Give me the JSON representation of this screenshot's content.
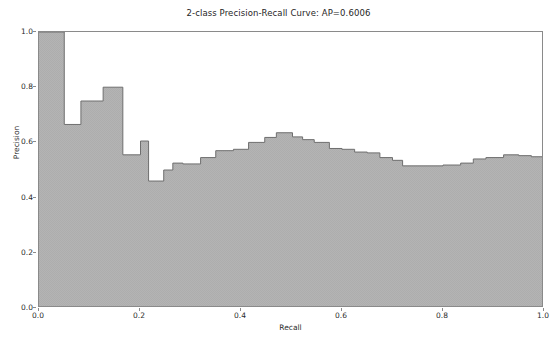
{
  "chart_data": {
    "type": "area",
    "title": "2-class Precision-Recall Curve: AP=0.6006",
    "xlabel": "Recall",
    "ylabel": "Precision",
    "xlim": [
      0.0,
      1.0
    ],
    "ylim": [
      0.0,
      1.0
    ],
    "grid": false,
    "legend": null,
    "step_mode": "post",
    "fill": true,
    "fill_color": "#adadad",
    "line_color": "#6e6e6e",
    "average_precision": 0.6006,
    "xticks": [
      0.0,
      0.2,
      0.4,
      0.6,
      0.8,
      1.0
    ],
    "xtick_labels": [
      "0.0",
      "0.2",
      "0.4",
      "0.6",
      "0.8",
      "1.0"
    ],
    "yticks": [
      0.0,
      0.2,
      0.4,
      0.6,
      0.8,
      1.0
    ],
    "ytick_labels": [
      "0.0",
      "0.2",
      "0.4",
      "0.6",
      "0.8",
      "1.0"
    ],
    "x": [
      0.0,
      0.05,
      0.083,
      0.127,
      0.166,
      0.201,
      0.217,
      0.247,
      0.265,
      0.285,
      0.32,
      0.35,
      0.385,
      0.415,
      0.447,
      0.47,
      0.502,
      0.522,
      0.545,
      0.575,
      0.6,
      0.625,
      0.65,
      0.675,
      0.7,
      0.72,
      0.8,
      0.835,
      0.86,
      0.885,
      0.92,
      0.95,
      0.975,
      1.0
    ],
    "y": [
      1.0,
      0.665,
      0.75,
      0.8,
      0.555,
      0.605,
      0.46,
      0.5,
      0.525,
      0.522,
      0.545,
      0.57,
      0.575,
      0.6,
      0.618,
      0.635,
      0.62,
      0.61,
      0.6,
      0.578,
      0.575,
      0.565,
      0.562,
      0.545,
      0.535,
      0.515,
      0.518,
      0.525,
      0.54,
      0.545,
      0.555,
      0.552,
      0.548,
      0.545
    ]
  }
}
